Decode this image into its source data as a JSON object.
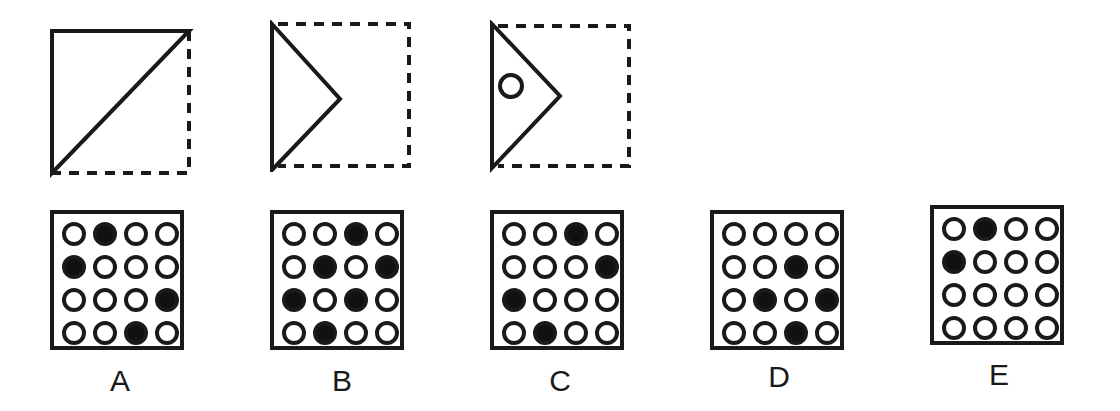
{
  "puzzle": {
    "fold_steps": [
      {
        "id": "step-1",
        "description": "square folded along diagonal"
      },
      {
        "id": "step-2",
        "description": "folded again into triangle"
      },
      {
        "id": "step-3",
        "description": "hole punched in folded triangle"
      }
    ],
    "options": [
      {
        "label": "A",
        "grid": [
          [
            0,
            1,
            0,
            0
          ],
          [
            1,
            0,
            0,
            0
          ],
          [
            0,
            0,
            0,
            1
          ],
          [
            0,
            0,
            1,
            0
          ]
        ]
      },
      {
        "label": "B",
        "grid": [
          [
            0,
            0,
            1,
            0
          ],
          [
            0,
            1,
            0,
            1
          ],
          [
            1,
            0,
            1,
            0
          ],
          [
            0,
            1,
            0,
            0
          ]
        ]
      },
      {
        "label": "C",
        "grid": [
          [
            0,
            0,
            1,
            0
          ],
          [
            0,
            0,
            0,
            1
          ],
          [
            1,
            0,
            0,
            0
          ],
          [
            0,
            1,
            0,
            0
          ]
        ]
      },
      {
        "label": "D",
        "grid": [
          [
            0,
            0,
            0,
            0
          ],
          [
            0,
            0,
            1,
            0
          ],
          [
            0,
            1,
            0,
            1
          ],
          [
            0,
            0,
            1,
            0
          ]
        ]
      },
      {
        "label": "E",
        "grid": [
          [
            0,
            1,
            0,
            0
          ],
          [
            1,
            0,
            0,
            0
          ],
          [
            0,
            0,
            0,
            0
          ],
          [
            0,
            0,
            0,
            0
          ]
        ]
      }
    ]
  }
}
